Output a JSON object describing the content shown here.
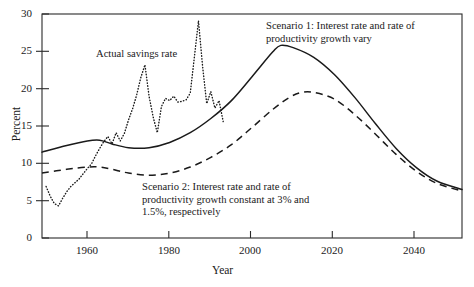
{
  "figure": {
    "background": "#ffffff",
    "ink_color": "#1a1a1a"
  },
  "axes": {
    "xlabel": "Year",
    "ylabel": "Percent",
    "x_ticks": [
      "1960",
      "1980",
      "2000",
      "2020",
      "2040"
    ],
    "y_ticks": [
      "0",
      "5",
      "10",
      "15",
      "20",
      "25",
      "30"
    ]
  },
  "annotations": {
    "actual": "Actual savings rate",
    "scenario1": "Scenario 1: Interest rate and rate of\nproductivity growth vary",
    "scenario2": "Scenario 2: Interest rate and rate of\nproductivity growth constant at 3% and\n1.5%, respectively"
  },
  "chart_data": {
    "type": "line",
    "title": "",
    "xlabel": "Year",
    "ylabel": "Percent",
    "xlim": [
      1949,
      2051
    ],
    "ylim": [
      0,
      30
    ],
    "xticks": [
      1960,
      1980,
      2000,
      2020,
      2040
    ],
    "yticks": [
      0,
      5,
      10,
      15,
      20,
      25,
      30
    ],
    "grid": false,
    "legend": "inline annotations",
    "series": [
      {
        "name": "Actual savings rate",
        "style": "dotted",
        "x": [
          1950,
          1951,
          1952,
          1953,
          1954,
          1955,
          1956,
          1957,
          1958,
          1959,
          1960,
          1961,
          1962,
          1963,
          1964,
          1965,
          1966,
          1967,
          1968,
          1969,
          1970,
          1971,
          1972,
          1973,
          1974,
          1975,
          1976,
          1977,
          1978,
          1979,
          1980,
          1981,
          1982,
          1983,
          1984,
          1985,
          1986,
          1987,
          1988,
          1989,
          1990,
          1991,
          1992,
          1993
        ],
        "values": [
          6.9,
          5.6,
          4.6,
          4.3,
          5.3,
          6.2,
          6.9,
          7.4,
          7.9,
          8.6,
          9.3,
          9.9,
          11.0,
          12.0,
          12.9,
          13.6,
          12.6,
          14.1,
          13.0,
          14.0,
          15.8,
          17.3,
          19.2,
          21.5,
          23.2,
          19.0,
          16.2,
          14.1,
          17.6,
          18.7,
          18.4,
          19.0,
          18.2,
          18.3,
          18.5,
          19.4,
          24.2,
          29.1,
          23.0,
          18.0,
          19.6,
          17.4,
          18.4,
          15.6
        ]
      },
      {
        "name": "Scenario 1: Interest rate and rate of productivity growth vary",
        "style": "solid",
        "x": [
          1949,
          1955,
          1960,
          1963,
          1966,
          1970,
          1975,
          1980,
          1985,
          1990,
          1995,
          2000,
          2005,
          2007,
          2010,
          2015,
          2020,
          2025,
          2030,
          2035,
          2040,
          2045,
          2051
        ],
        "values": [
          11.5,
          12.4,
          13.0,
          13.1,
          12.6,
          12.1,
          12.1,
          12.8,
          14.1,
          16.0,
          18.4,
          21.6,
          24.9,
          25.8,
          25.5,
          24.2,
          21.9,
          18.8,
          15.3,
          12.0,
          9.4,
          7.6,
          6.5
        ]
      },
      {
        "name": "Scenario 2: Interest rate and rate of productivity growth constant at 3% and 1.5%, respectively",
        "style": "dashed",
        "x": [
          1949,
          1955,
          1960,
          1963,
          1966,
          1970,
          1975,
          1980,
          1985,
          1990,
          1995,
          2000,
          2005,
          2009,
          2012,
          2015,
          2020,
          2025,
          2030,
          2035,
          2040,
          2045,
          2051
        ],
        "values": [
          8.7,
          9.2,
          9.5,
          9.5,
          9.2,
          8.7,
          8.4,
          8.7,
          9.5,
          10.8,
          12.5,
          14.8,
          17.2,
          18.8,
          19.5,
          19.5,
          18.6,
          16.5,
          13.9,
          11.2,
          8.9,
          7.3,
          6.3
        ]
      }
    ]
  }
}
